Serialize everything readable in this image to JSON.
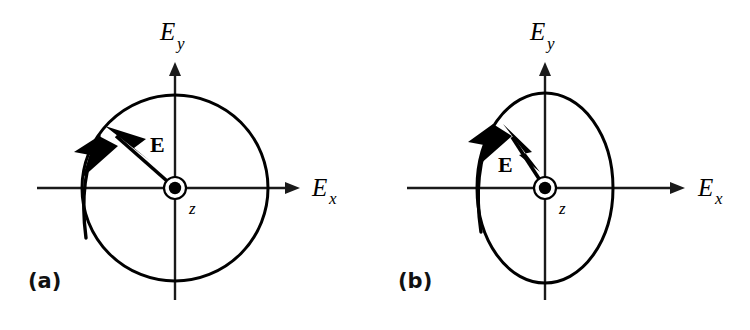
{
  "figure": {
    "background_color": "#ffffff",
    "stroke_color": "#000000",
    "panels": [
      {
        "id": "a",
        "label": "(a)",
        "label_x": 28,
        "label_y": 288,
        "polarization_state": "circular",
        "curve": {
          "type": "circle",
          "cx": 175,
          "cy": 188,
          "rx": 93,
          "ry": 93
        },
        "origin": {
          "cx": 175,
          "cy": 188,
          "ring_r": 11,
          "dot_r": 6,
          "symbol": "z-out-of-page",
          "label": "z",
          "label_x": 189,
          "label_y": 214
        },
        "x_axis": {
          "label": "E",
          "subscript": "x",
          "x1": 37,
          "x2": 300,
          "y": 188,
          "label_x": 312,
          "label_y": 196,
          "sub_x": 329,
          "sub_y": 204
        },
        "y_axis": {
          "label": "E",
          "subscript": "y",
          "x": 175,
          "y1": 300,
          "y2": 62,
          "label_x": 160,
          "label_y": 40,
          "sub_x": 177,
          "sub_y": 49
        },
        "e_vector": {
          "label": "E",
          "label_x": 150,
          "label_y": 152,
          "tail_x": 175,
          "tail_y": 188,
          "tip_x": 107,
          "tip_y": 128
        },
        "rotation_arrow": {
          "direction": "counterclockwise",
          "tip_x": 92,
          "tip_y": 124
        }
      },
      {
        "id": "b",
        "label": "(b)",
        "label_x": 398,
        "label_y": 288,
        "polarization_state": "elliptical",
        "curve": {
          "type": "ellipse",
          "cx": 545,
          "cy": 188,
          "rx": 68,
          "ry": 95
        },
        "origin": {
          "cx": 545,
          "cy": 188,
          "ring_r": 11,
          "dot_r": 6,
          "symbol": "z-out-of-page",
          "label": "z",
          "label_x": 559,
          "label_y": 214
        },
        "x_axis": {
          "label": "E",
          "subscript": "x",
          "x1": 407,
          "x2": 685,
          "y": 188,
          "label_x": 698,
          "label_y": 196,
          "sub_x": 715,
          "sub_y": 204
        },
        "y_axis": {
          "label": "E",
          "subscript": "y",
          "x": 545,
          "y1": 300,
          "y2": 62,
          "label_x": 530,
          "label_y": 40,
          "sub_x": 547,
          "sub_y": 49
        },
        "e_vector": {
          "label": "E",
          "label_x": 500,
          "label_y": 170,
          "tail_x": 545,
          "tail_y": 188,
          "tip_x": 502,
          "tip_y": 128
        },
        "rotation_arrow": {
          "direction": "counterclockwise",
          "tip_x": 485,
          "tip_y": 120
        }
      }
    ]
  }
}
